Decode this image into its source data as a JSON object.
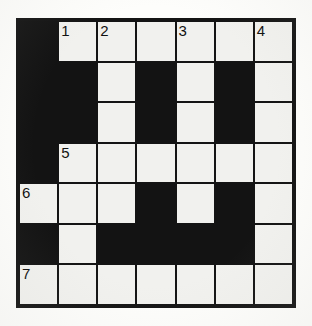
{
  "puzzle": {
    "title": "Crossword Grid",
    "type": "crossword",
    "rows": 7,
    "columns": 7,
    "colors": {
      "block": "#131313",
      "cell": "#f1f1ee",
      "grid_line": "#141414",
      "page_background": "#fdfdfb",
      "number_text": "#111111"
    },
    "clue_numbers_visible": [
      "1",
      "2",
      "3",
      "4",
      "5",
      "6",
      "7"
    ],
    "grid": [
      [
        {
          "state": "block",
          "number": ""
        },
        {
          "state": "open",
          "number": "1"
        },
        {
          "state": "open",
          "number": "2"
        },
        {
          "state": "open",
          "number": ""
        },
        {
          "state": "open",
          "number": "3"
        },
        {
          "state": "open",
          "number": ""
        },
        {
          "state": "open",
          "number": "4"
        }
      ],
      [
        {
          "state": "block",
          "number": ""
        },
        {
          "state": "block",
          "number": ""
        },
        {
          "state": "open",
          "number": ""
        },
        {
          "state": "block",
          "number": ""
        },
        {
          "state": "open",
          "number": ""
        },
        {
          "state": "block",
          "number": ""
        },
        {
          "state": "open",
          "number": ""
        }
      ],
      [
        {
          "state": "block",
          "number": ""
        },
        {
          "state": "block",
          "number": ""
        },
        {
          "state": "open",
          "number": ""
        },
        {
          "state": "block",
          "number": ""
        },
        {
          "state": "open",
          "number": ""
        },
        {
          "state": "block",
          "number": ""
        },
        {
          "state": "open",
          "number": ""
        }
      ],
      [
        {
          "state": "block",
          "number": ""
        },
        {
          "state": "open",
          "number": "5"
        },
        {
          "state": "open",
          "number": ""
        },
        {
          "state": "open",
          "number": ""
        },
        {
          "state": "open",
          "number": ""
        },
        {
          "state": "open",
          "number": ""
        },
        {
          "state": "open",
          "number": ""
        }
      ],
      [
        {
          "state": "open",
          "number": "6"
        },
        {
          "state": "open",
          "number": ""
        },
        {
          "state": "open",
          "number": ""
        },
        {
          "state": "block",
          "number": ""
        },
        {
          "state": "open",
          "number": ""
        },
        {
          "state": "block",
          "number": ""
        },
        {
          "state": "open",
          "number": ""
        }
      ],
      [
        {
          "state": "block",
          "number": ""
        },
        {
          "state": "open",
          "number": ""
        },
        {
          "state": "block",
          "number": ""
        },
        {
          "state": "block",
          "number": ""
        },
        {
          "state": "block",
          "number": ""
        },
        {
          "state": "block",
          "number": ""
        },
        {
          "state": "open",
          "number": ""
        }
      ],
      [
        {
          "state": "open",
          "number": "7"
        },
        {
          "state": "open",
          "number": ""
        },
        {
          "state": "open",
          "number": ""
        },
        {
          "state": "open",
          "number": ""
        },
        {
          "state": "open",
          "number": ""
        },
        {
          "state": "open",
          "number": ""
        },
        {
          "state": "open",
          "number": ""
        }
      ]
    ]
  }
}
